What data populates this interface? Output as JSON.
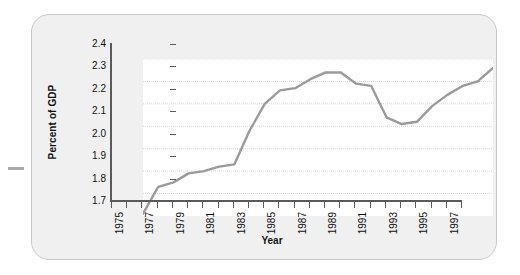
{
  "figure": {
    "panel_background": "#f0f0f0",
    "plot_background": "#ffffff",
    "line_color": "#9a9a9a",
    "axis_color": "#5a5a5a",
    "grid_color": "#d8d8d8"
  },
  "chart_data": {
    "type": "line",
    "title": "",
    "xlabel": "Year",
    "ylabel": "Percent of GDP",
    "xlim": [
      1975,
      1998
    ],
    "ylim": [
      1.7,
      2.4
    ],
    "ytick_labels": [
      "2.4",
      "2.3",
      "2.2",
      "2.1",
      "2.0",
      "1.9",
      "1.8",
      "1.7"
    ],
    "ytick_values": [
      2.4,
      2.3,
      2.2,
      2.1,
      2.0,
      1.9,
      1.8,
      1.7
    ],
    "xtick_labels": [
      "1975",
      "1977",
      "1979",
      "1981",
      "1983",
      "1985",
      "1987",
      "1989",
      "1991",
      "1993",
      "1995",
      "1997"
    ],
    "xtick_values": [
      1975,
      1977,
      1979,
      1981,
      1983,
      1985,
      1987,
      1989,
      1991,
      1993,
      1995,
      1997
    ],
    "grid": "horizontal-dotted",
    "legend": "none",
    "x": [
      1975,
      1976,
      1977,
      1978,
      1979,
      1980,
      1981,
      1982,
      1983,
      1984,
      1985,
      1986,
      1987,
      1988,
      1989,
      1990,
      1991,
      1992,
      1993,
      1994,
      1995,
      1996,
      1997,
      1998
    ],
    "values": [
      1.71,
      1.83,
      1.85,
      1.89,
      1.9,
      1.92,
      1.93,
      2.08,
      2.2,
      2.26,
      2.27,
      2.31,
      2.34,
      2.34,
      2.29,
      2.28,
      2.14,
      2.11,
      2.12,
      2.19,
      2.24,
      2.28,
      2.3,
      2.36
    ],
    "series": [
      {
        "name": "Percent of GDP",
        "values": [
          1.71,
          1.83,
          1.85,
          1.89,
          1.9,
          1.92,
          1.93,
          2.08,
          2.2,
          2.26,
          2.27,
          2.31,
          2.34,
          2.34,
          2.29,
          2.28,
          2.14,
          2.11,
          2.12,
          2.19,
          2.24,
          2.28,
          2.3,
          2.36
        ]
      }
    ]
  }
}
